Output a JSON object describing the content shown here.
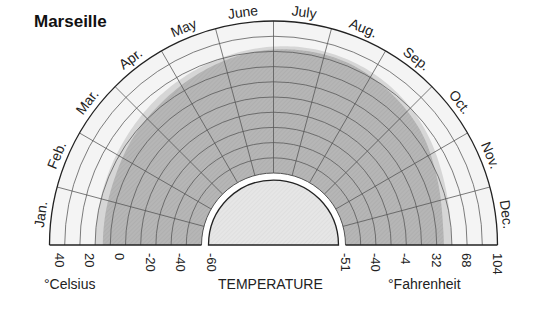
{
  "chart_data": {
    "type": "radial-area",
    "title": "Marseille",
    "xlabel": "TEMPERATURE",
    "categories": [
      "Jan.",
      "Feb.",
      "Mar.",
      "Apr.",
      "May",
      "June",
      "July",
      "Aug.",
      "Sep.",
      "Oct.",
      "Nov.",
      "Dec."
    ],
    "series": [
      {
        "name": "Maximum temperature band (light gray)",
        "unit": "°C",
        "values": [
          10,
          11,
          13,
          16,
          19,
          22,
          24,
          24,
          22,
          18,
          13,
          10
        ]
      },
      {
        "name": "Mean temperature (dark hatched gray)",
        "unit": "°C",
        "values": [
          5,
          6,
          9,
          12,
          16,
          20,
          22,
          22,
          19,
          15,
          9,
          5
        ]
      }
    ],
    "celsius_axis": {
      "label": "°Celsius",
      "ticks": [
        "40",
        "20",
        "0",
        "-20",
        "-40",
        "-60"
      ],
      "range": [
        -60,
        40
      ]
    },
    "fahrenheit_axis": {
      "label": "°Fahrenheit",
      "ticks": [
        "-51",
        "-40",
        "-4",
        "32",
        "68",
        "104"
      ]
    },
    "grid": true,
    "ring_step_celsius": 10
  },
  "colors": {
    "dark_fill": "#b4b4b4",
    "light_fill": "#d6d6d6",
    "background_band": "#f4f4f4",
    "grid_line": "#555555",
    "outline": "#222222",
    "inner_disk": "#e2e2e2"
  }
}
